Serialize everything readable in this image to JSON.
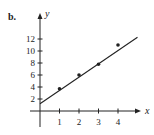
{
  "figure": {
    "part_label": "b."
  },
  "chart_data": {
    "type": "scatter",
    "title": "",
    "xlabel": "x",
    "ylabel": "y",
    "x_ticks": [
      1,
      2,
      3,
      4
    ],
    "y_ticks": [
      2,
      4,
      6,
      8,
      10,
      12
    ],
    "xlim": [
      -0.5,
      5.1
    ],
    "ylim": [
      -2.7,
      16
    ],
    "grid": false,
    "legend": null,
    "series": [
      {
        "name": "data points",
        "kind": "scatter",
        "x": [
          1,
          2,
          3,
          4
        ],
        "y": [
          3.7,
          6.0,
          7.8,
          11.0
        ]
      },
      {
        "name": "fitted line",
        "kind": "line",
        "x": [
          0,
          5
        ],
        "y": [
          1.2,
          12.3
        ]
      }
    ]
  },
  "colors": {
    "ink": "#222222",
    "background": "#ffffff"
  }
}
